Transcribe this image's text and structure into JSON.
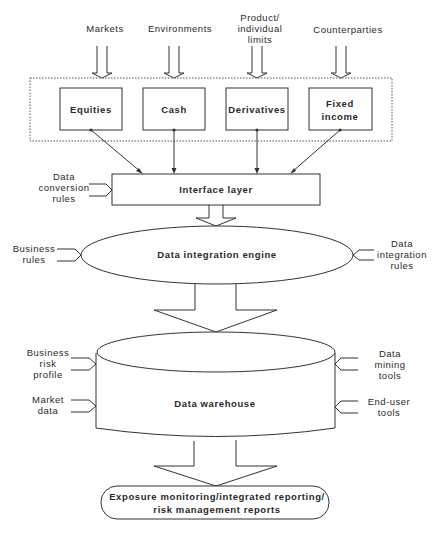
{
  "inputs_top": [
    "Markets",
    "Environments",
    [
      "Product/",
      "individual",
      "limits"
    ],
    "Counterparties"
  ],
  "products": {
    "equities": "Equities",
    "cash": "Cash",
    "derivatives": "Derivatives",
    "fixed_income": [
      "Fixed",
      "income"
    ]
  },
  "interface_layer": {
    "label": "Interface layer",
    "left_input": [
      "Data",
      "conversion",
      "rules"
    ]
  },
  "integration_engine": {
    "label": "Data integration engine",
    "left_input": [
      "Business",
      "rules"
    ],
    "right_input": [
      "Data",
      "integration",
      "rules"
    ]
  },
  "warehouse": {
    "label": "Data warehouse",
    "left_inputs": [
      [
        "Business",
        "risk",
        "profile"
      ],
      [
        "Market",
        "data"
      ]
    ],
    "right_inputs": [
      [
        "Data",
        "mining",
        "tools"
      ],
      [
        "End-user",
        "tools"
      ]
    ]
  },
  "output": {
    "lines": [
      "Exposure monitoring/integrated reporting/",
      "risk management reports"
    ]
  }
}
